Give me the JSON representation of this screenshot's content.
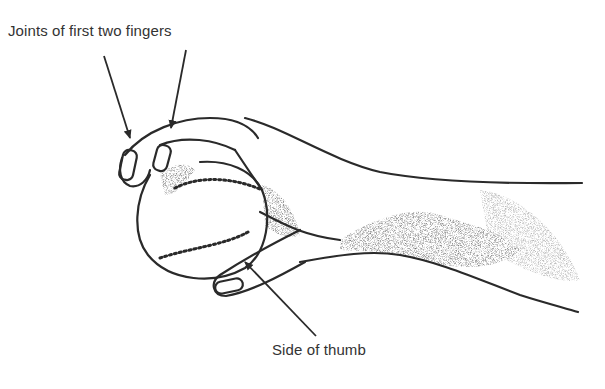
{
  "figure": {
    "labels": {
      "top": "Joints of first two fingers",
      "bottom": "Side of thumb"
    },
    "colors": {
      "ink": "#2a2a2a",
      "background": "#ffffff"
    }
  }
}
